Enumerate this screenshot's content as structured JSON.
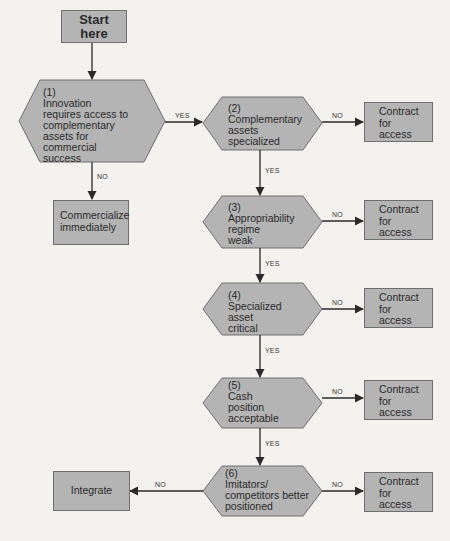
{
  "start": {
    "label": "Start\nhere",
    "line1": "Start",
    "line2": "here"
  },
  "decisions": [
    {
      "num": "(1)",
      "lines": [
        "Innovation",
        "requires access to",
        "complementary",
        "assets for",
        "commercial",
        "success"
      ]
    },
    {
      "num": "(2)",
      "lines": [
        "Complementary",
        "assets",
        "specialized"
      ]
    },
    {
      "num": "(3)",
      "lines": [
        "Appropriability",
        "regime",
        "weak"
      ]
    },
    {
      "num": "(4)",
      "lines": [
        "Specialized",
        "asset",
        "critical"
      ]
    },
    {
      "num": "(5)",
      "lines": [
        "Cash",
        "position",
        "acceptable"
      ]
    },
    {
      "num": "(6)",
      "lines": [
        "Imitators/",
        "competitors better",
        "positioned"
      ]
    }
  ],
  "outcomes": {
    "commercialize": {
      "line1": "Commercialize",
      "line2": "immediately"
    },
    "integrate": {
      "label": "Integrate"
    },
    "contract": {
      "line1": "Contract",
      "line2": "for",
      "line3": "access"
    }
  },
  "edge_labels": {
    "yes": "YES",
    "no": "NO"
  },
  "colors": {
    "shape_fill": "#b4b4b4",
    "shape_stroke": "#6f6f6f",
    "line": "#2a2a2a",
    "background": "#f4f2ee"
  }
}
